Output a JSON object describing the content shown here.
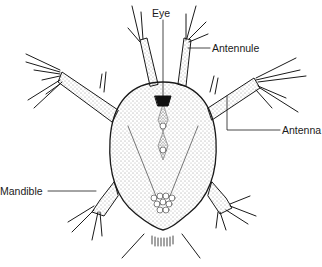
{
  "figure": {
    "labels": {
      "eye": "Eye",
      "antennule": "Antennule",
      "antenna": "Antenna",
      "mandible": "Mandible"
    },
    "colors": {
      "ink": "#1a1a1a",
      "background": "#ffffff"
    }
  }
}
